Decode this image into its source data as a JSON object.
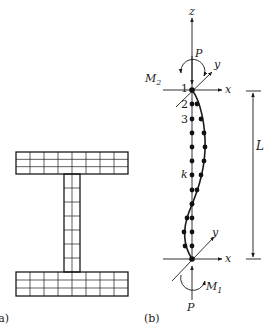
{
  "figure": {
    "panel_a": {
      "label": "(a)",
      "description": "I-section cross-section discretized into fiber mesh",
      "top_flange": {
        "x": 16,
        "y": 152,
        "width": 112,
        "height": 22,
        "rows": 3,
        "cols": 8
      },
      "web": {
        "x": 64,
        "y": 174,
        "width": 16,
        "height": 98,
        "rows": 7,
        "cols": 2
      },
      "bottom_flange": {
        "x": 16,
        "y": 272,
        "width": 112,
        "height": 24,
        "rows": 3,
        "cols": 8
      }
    },
    "panel_b": {
      "label": "(b)",
      "top_node": {
        "label": "1",
        "x": 192,
        "y": 90
      },
      "bottom_node": {
        "x": 192,
        "y": 259
      },
      "node_labels": [
        {
          "text": "1",
          "x": 181,
          "y": 92
        },
        {
          "text": "2",
          "x": 181,
          "y": 108
        },
        {
          "text": "3",
          "x": 181,
          "y": 123
        },
        {
          "text": "k",
          "x": 181,
          "y": 178
        }
      ],
      "straight_nodes_y": [
        104,
        119,
        133,
        147,
        161,
        175,
        190,
        204,
        218,
        232,
        246
      ],
      "deformed_nodes": [
        [
          197,
          104
        ],
        [
          201,
          119
        ],
        [
          204,
          133
        ],
        [
          205,
          147
        ],
        [
          204,
          161
        ],
        [
          201,
          175
        ],
        [
          197,
          190
        ],
        [
          192,
          204
        ],
        [
          187,
          218
        ],
        [
          184,
          232
        ],
        [
          185,
          246
        ]
      ],
      "top_axes": {
        "z_label": "z",
        "x_label": "x",
        "y_label": "y"
      },
      "bottom_axes": {
        "x_label": "x",
        "y_label": "y"
      },
      "top_load": {
        "force_label": "P",
        "moment_label": "M",
        "moment_subscript": "2"
      },
      "bottom_load": {
        "force_label": "P",
        "moment_label": "M",
        "moment_subscript": "1"
      },
      "dimension": {
        "label": "L",
        "x": 253,
        "y_top": 91,
        "y_bottom": 259
      }
    }
  }
}
